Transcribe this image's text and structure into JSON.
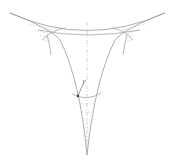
{
  "diagram": {
    "title": "",
    "colors": {
      "curve": "#9a9a9a",
      "axis": "#b5b5b5",
      "hatch": "#a8a8a8",
      "marker": "#333333"
    },
    "labels": {
      "point_label": "γ"
    }
  }
}
